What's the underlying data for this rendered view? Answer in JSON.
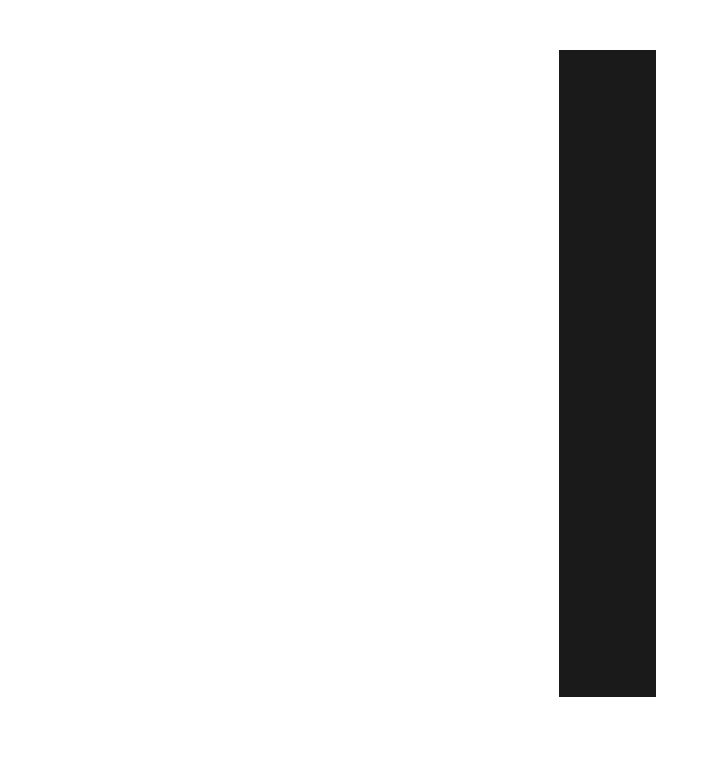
{
  "page": {
    "background_color": "#ffffff"
  },
  "panel": {
    "color": "#1a1a1a"
  }
}
